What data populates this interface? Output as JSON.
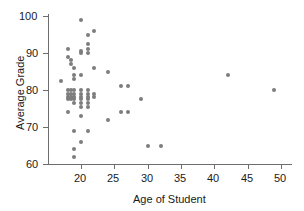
{
  "chart_data": {
    "type": "scatter",
    "title": "",
    "xlabel": "Age of Student",
    "ylabel": "Average Grade",
    "xlim": [
      16,
      51
    ],
    "ylim": [
      59,
      101
    ],
    "xticks": [
      20,
      25,
      30,
      35,
      40,
      45,
      50
    ],
    "yticks": [
      60,
      70,
      80,
      90,
      100
    ],
    "grid": false,
    "legend": null,
    "marker_color": "#7d7d7d",
    "axis_color": "#6d6d6d",
    "points": [
      {
        "x": 17,
        "y": 82.5
      },
      {
        "x": 18,
        "y": 91
      },
      {
        "x": 18,
        "y": 89
      },
      {
        "x": 18.5,
        "y": 88
      },
      {
        "x": 18.5,
        "y": 87
      },
      {
        "x": 19,
        "y": 86
      },
      {
        "x": 19,
        "y": 84
      },
      {
        "x": 19,
        "y": 83
      },
      {
        "x": 18,
        "y": 80
      },
      {
        "x": 18,
        "y": 79
      },
      {
        "x": 18,
        "y": 78
      },
      {
        "x": 18,
        "y": 77.5
      },
      {
        "x": 18.5,
        "y": 80
      },
      {
        "x": 18.5,
        "y": 79
      },
      {
        "x": 18.5,
        "y": 78
      },
      {
        "x": 18.5,
        "y": 77.5
      },
      {
        "x": 18,
        "y": 74
      },
      {
        "x": 19,
        "y": 80
      },
      {
        "x": 19,
        "y": 79
      },
      {
        "x": 19,
        "y": 78
      },
      {
        "x": 19,
        "y": 77.5
      },
      {
        "x": 19,
        "y": 76.5
      },
      {
        "x": 19,
        "y": 69
      },
      {
        "x": 19,
        "y": 64
      },
      {
        "x": 19,
        "y": 62
      },
      {
        "x": 20,
        "y": 99
      },
      {
        "x": 20,
        "y": 90.5
      },
      {
        "x": 20,
        "y": 90
      },
      {
        "x": 20,
        "y": 84
      },
      {
        "x": 20,
        "y": 80
      },
      {
        "x": 20,
        "y": 79
      },
      {
        "x": 20,
        "y": 78
      },
      {
        "x": 20,
        "y": 77.5
      },
      {
        "x": 20,
        "y": 76.5
      },
      {
        "x": 20,
        "y": 75.5
      },
      {
        "x": 20,
        "y": 73
      },
      {
        "x": 20,
        "y": 66
      },
      {
        "x": 21,
        "y": 95
      },
      {
        "x": 21,
        "y": 92.5
      },
      {
        "x": 21,
        "y": 91
      },
      {
        "x": 21,
        "y": 90
      },
      {
        "x": 21,
        "y": 80
      },
      {
        "x": 21,
        "y": 79
      },
      {
        "x": 21,
        "y": 78
      },
      {
        "x": 21,
        "y": 77.5
      },
      {
        "x": 21,
        "y": 76.5
      },
      {
        "x": 21,
        "y": 75.5
      },
      {
        "x": 21,
        "y": 69
      },
      {
        "x": 22,
        "y": 96
      },
      {
        "x": 22,
        "y": 86
      },
      {
        "x": 22,
        "y": 79
      },
      {
        "x": 22,
        "y": 78
      },
      {
        "x": 24,
        "y": 85
      },
      {
        "x": 24,
        "y": 72
      },
      {
        "x": 26,
        "y": 81
      },
      {
        "x": 27,
        "y": 81
      },
      {
        "x": 26,
        "y": 74
      },
      {
        "x": 27,
        "y": 74
      },
      {
        "x": 29,
        "y": 77.5
      },
      {
        "x": 30,
        "y": 65
      },
      {
        "x": 32,
        "y": 65
      },
      {
        "x": 42,
        "y": 84
      },
      {
        "x": 49,
        "y": 80
      }
    ]
  },
  "plot_geometry": {
    "x_origin_px": 81,
    "x_value_at_origin": 20,
    "px_per_x_unit": 6.6667,
    "y_origin_px": 164,
    "y_value_at_origin": 60,
    "px_per_y_unit": 3.7,
    "axis_left_px": 48,
    "axis_bottom_px": 164,
    "axis_top_px": 16,
    "axis_right_px": 292
  }
}
